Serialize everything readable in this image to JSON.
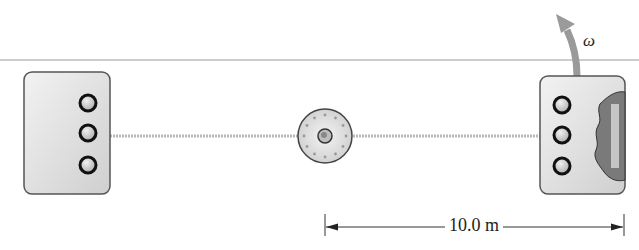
{
  "diagram": {
    "type": "rotating space station schematic",
    "components": [
      {
        "name": "left-module",
        "portholes": 3
      },
      {
        "name": "central-hub"
      },
      {
        "name": "right-module",
        "portholes": 3,
        "cutaway": true
      }
    ],
    "rotation_label": "ω",
    "dimension_label": "10.0 m",
    "colors": {
      "module_fill": "#d9d9d9",
      "outline": "#555555",
      "arrow": "#9a9a9a",
      "cutaway": "#7a7a7a"
    }
  }
}
